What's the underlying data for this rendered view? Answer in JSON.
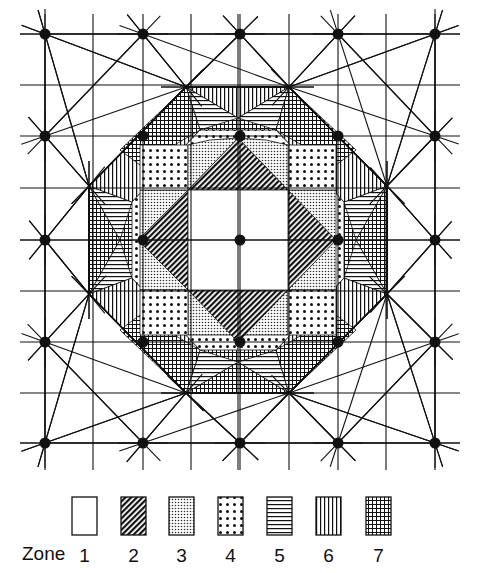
{
  "figure": {
    "grid": {
      "dot_columns": [
        45,
        143,
        240,
        338,
        435
      ],
      "dot_rows": [
        34,
        136,
        240,
        342,
        443
      ],
      "mid_columns": [
        93,
        191,
        289,
        386
      ],
      "mid_rows": [
        85,
        188,
        291,
        393
      ]
    },
    "octagon_vertices": [
      [
        186,
        87
      ],
      [
        289,
        87
      ],
      [
        387,
        186
      ],
      [
        387,
        294
      ],
      [
        289,
        393
      ],
      [
        186,
        393
      ],
      [
        89,
        294
      ],
      [
        89,
        186
      ]
    ],
    "center_square": {
      "x1": 188,
      "y1": 190,
      "x2": 288,
      "y2": 290
    },
    "line_color": "#111111",
    "dot_color": "#111111"
  },
  "legend": {
    "title": "Zone",
    "zones": [
      {
        "number": "1",
        "pattern": "blank"
      },
      {
        "number": "2",
        "pattern": "dense-diagonal"
      },
      {
        "number": "3",
        "pattern": "fine-stipple"
      },
      {
        "number": "4",
        "pattern": "dots"
      },
      {
        "number": "5",
        "pattern": "horizontal-lines"
      },
      {
        "number": "6",
        "pattern": "vertical-lines"
      },
      {
        "number": "7",
        "pattern": "crosshatch"
      }
    ]
  }
}
